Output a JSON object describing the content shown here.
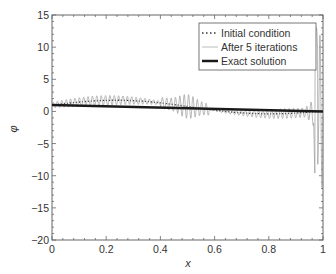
{
  "chart_data": {
    "type": "line",
    "title": "",
    "xlabel": "x",
    "ylabel": "φ",
    "xlim": [
      0,
      1
    ],
    "ylim": [
      -20,
      15
    ],
    "xticks": [
      0,
      0.2,
      0.4,
      0.6,
      0.8,
      1
    ],
    "xtick_labels": [
      "0",
      "0.2",
      "0.4",
      "0.6",
      "0.8",
      "1"
    ],
    "yticks": [
      15,
      10,
      5,
      0,
      -5,
      -10,
      -15,
      -20
    ],
    "ytick_labels": [
      "15",
      "10",
      "5",
      "0",
      "−5",
      "−10",
      "−15",
      "−20"
    ],
    "grid": false,
    "legend_position": "upper right",
    "series": [
      {
        "name": "Initial condition",
        "style": "dotted",
        "color": "#333333",
        "x": [
          0,
          0.1,
          0.2,
          0.3,
          0.4,
          0.5,
          0.6,
          0.7,
          0.8,
          0.9,
          1.0
        ],
        "values": [
          1.0,
          1.4,
          1.7,
          1.8,
          1.6,
          0.9,
          0.1,
          -0.5,
          -0.7,
          -0.3,
          0.0
        ]
      },
      {
        "name": "After 5 iterations",
        "style": "solid-thin",
        "color": "#999999",
        "x": [
          0,
          0.1,
          0.2,
          0.3,
          0.4,
          0.45,
          0.5,
          0.55,
          0.6,
          0.7,
          0.8,
          0.9,
          0.95,
          0.97,
          0.98,
          0.99,
          1.0
        ],
        "values": [
          1.0,
          1.5,
          1.8,
          1.8,
          1.7,
          2.5,
          1.0,
          -1.5,
          0.2,
          -0.5,
          -0.8,
          -0.4,
          2.0,
          -14.0,
          4.0,
          12.0,
          0.0
        ]
      },
      {
        "name": "Exact solution",
        "style": "solid-thick",
        "color": "#1a1a1a",
        "x": [
          0,
          1
        ],
        "values": [
          1.0,
          0.0
        ]
      }
    ]
  },
  "legend": {
    "items": [
      {
        "label": "Initial condition"
      },
      {
        "label": "After 5 iterations"
      },
      {
        "label": "Exact solution"
      }
    ]
  },
  "axes": {
    "xlabel": "x",
    "ylabel": "φ",
    "xtick_labels": [
      "0",
      "0.2",
      "0.4",
      "0.6",
      "0.8",
      "1"
    ],
    "ytick_labels": [
      "15",
      "10",
      "5",
      "0",
      "−5",
      "−10",
      "−15",
      "−20"
    ]
  }
}
